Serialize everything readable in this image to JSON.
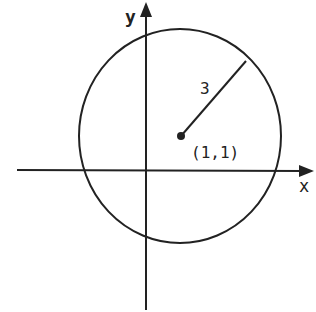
{
  "diagram": {
    "x_axis_label": "x",
    "y_axis_label": "y",
    "radius_label": "3",
    "center_label": "(1,1)",
    "colors": {
      "ink": "#222222",
      "background": "#ffffff"
    }
  }
}
